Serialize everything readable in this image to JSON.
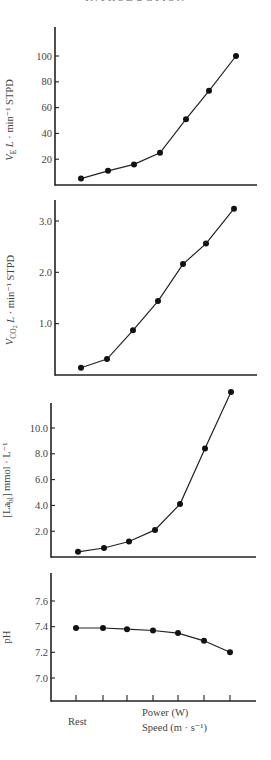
{
  "page_header": "INTRODUCTION",
  "x_axis": {
    "rest_label": "Rest",
    "power_label": "Power (W)",
    "speed_label": "Speed (m · s⁻¹)"
  },
  "chart_data": [
    {
      "type": "line",
      "title": "",
      "ylabel": "V'E L · min⁻¹ STPD",
      "xlabel": "Rest → Power (W) / Speed (m · s⁻¹)",
      "x": [
        1,
        2,
        3,
        4,
        5,
        6,
        7
      ],
      "values": [
        5,
        11,
        16,
        25,
        51,
        73,
        100
      ],
      "yticks": [
        20,
        40,
        60,
        80,
        100
      ],
      "ylim": [
        0,
        125
      ],
      "grid": false
    },
    {
      "type": "line",
      "title": "",
      "ylabel": "V'CO2 L · min⁻¹ STPD",
      "xlabel": "Rest → Power (W) / Speed (m · s⁻¹)",
      "x": [
        1,
        2,
        3,
        4,
        5,
        6,
        7
      ],
      "values": [
        0.14,
        0.31,
        0.87,
        1.44,
        2.16,
        2.56,
        3.24
      ],
      "yticks": [
        1.0,
        2.0,
        3.0
      ],
      "ylim": [
        0,
        3.4
      ],
      "grid": false
    },
    {
      "type": "line",
      "title": "",
      "ylabel": "[La_bl] mmol · L⁻¹",
      "xlabel": "Rest → Power (W) / Speed (m · s⁻¹)",
      "x": [
        1,
        2,
        3,
        4,
        5,
        6,
        7
      ],
      "values": [
        0.4,
        0.7,
        1.2,
        2.1,
        4.1,
        8.4,
        12.8
      ],
      "yticks": [
        2.0,
        4.0,
        6.0,
        8.0,
        10.0
      ],
      "ylim": [
        0,
        12
      ],
      "grid": false
    },
    {
      "type": "line",
      "title": "",
      "ylabel": "pH",
      "xlabel": "Rest → Power (W) / Speed (m · s⁻¹)",
      "x": [
        1,
        2,
        3,
        4,
        5,
        6,
        7
      ],
      "values": [
        7.39,
        7.39,
        7.38,
        7.37,
        7.35,
        7.29,
        7.2
      ],
      "yticks": [
        7.0,
        7.2,
        7.4,
        7.6
      ],
      "ylim": [
        6.82,
        7.8
      ],
      "grid": false
    }
  ]
}
